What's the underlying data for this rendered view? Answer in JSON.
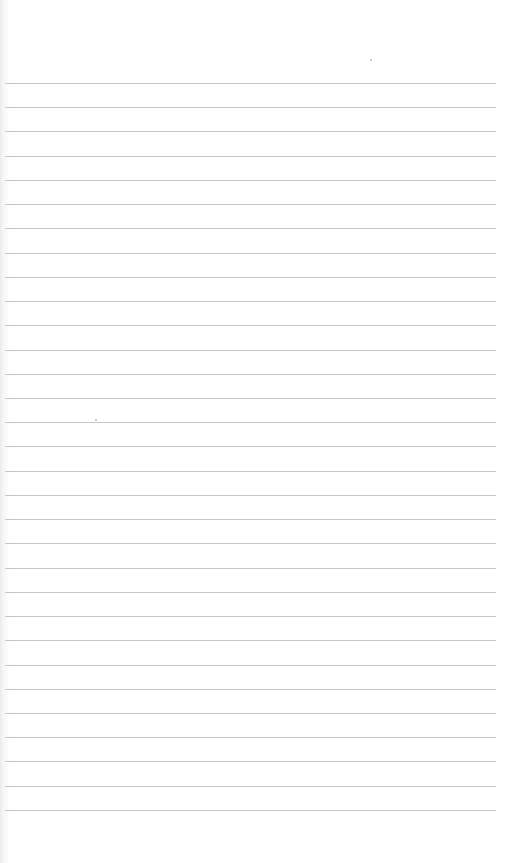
{
  "page": {
    "type": "lined-paper",
    "background_color": "#ffffff",
    "rule_color": "#c4c4c4",
    "rule_count": 31,
    "first_rule_y": 83,
    "rule_spacing": 24.23,
    "rule_left": 5,
    "rule_right": 496,
    "text": ""
  }
}
